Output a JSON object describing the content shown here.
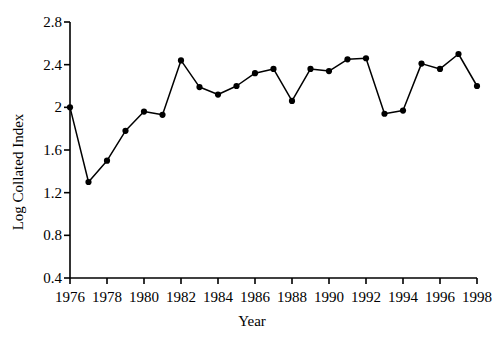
{
  "chart_data": {
    "type": "line",
    "title": "",
    "xlabel": "Year",
    "ylabel": "Log Collated Index",
    "x": [
      1976,
      1977,
      1978,
      1979,
      1980,
      1981,
      1982,
      1983,
      1984,
      1985,
      1986,
      1987,
      1988,
      1989,
      1990,
      1991,
      1992,
      1993,
      1994,
      1995,
      1996,
      1997,
      1998
    ],
    "values": [
      2.0,
      1.3,
      1.5,
      1.78,
      1.96,
      1.93,
      2.44,
      2.19,
      2.12,
      2.2,
      2.32,
      2.36,
      2.06,
      2.36,
      2.34,
      2.45,
      2.46,
      1.94,
      1.97,
      2.41,
      2.36,
      2.5,
      2.2
    ],
    "series": [
      {
        "name": "Log Collated Index",
        "values": [
          2.0,
          1.3,
          1.5,
          1.78,
          1.96,
          1.93,
          2.44,
          2.19,
          2.12,
          2.2,
          2.32,
          2.36,
          2.06,
          2.36,
          2.34,
          2.45,
          2.46,
          1.94,
          1.97,
          2.41,
          2.36,
          2.5,
          2.2
        ],
        "color": "#000000",
        "marker": "filled-circle"
      }
    ],
    "xlim": [
      1976,
      1998
    ],
    "ylim": [
      0.4,
      2.8
    ],
    "xticks": [
      1976,
      1978,
      1980,
      1982,
      1984,
      1986,
      1988,
      1990,
      1992,
      1994,
      1996,
      1998
    ],
    "xtick_labels": [
      "1976",
      "1978",
      "1980",
      "1982",
      "1984",
      "1986",
      "1988",
      "1990",
      "1992",
      "1994",
      "1996",
      "1998"
    ],
    "yticks": [
      0.4,
      0.8,
      1.2,
      1.6,
      2.0,
      2.4,
      2.8
    ],
    "ytick_labels": [
      "0.4",
      "0.8",
      "1.2",
      "1.6",
      "2",
      "2.4",
      "2.8"
    ],
    "grid": false,
    "legend": "none"
  },
  "axis_titles": {
    "y": "Log Collated Index",
    "x": "Year"
  }
}
